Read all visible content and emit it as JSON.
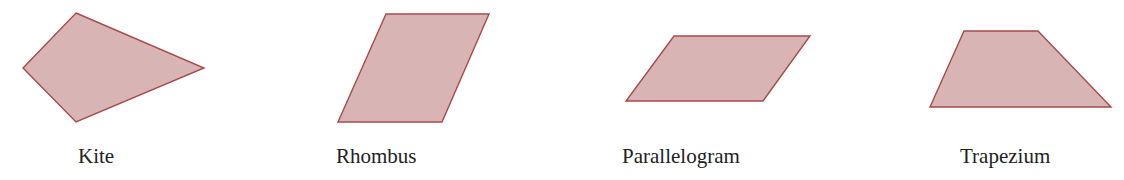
{
  "figure": {
    "style": {
      "fill": "#d9b4b4",
      "stroke": "#a84a4a",
      "label_color": "#222222",
      "background": "#ffffff"
    },
    "shapes": [
      {
        "name": "Kite",
        "label": "Kite",
        "points": "76,13 204,68 76,122 23,68",
        "label_x": 78
      },
      {
        "name": "Rhombus",
        "label": "Rhombus",
        "points": "386,14 489,14 442,122 338,122",
        "label_x": 336
      },
      {
        "name": "Parallelogram",
        "label": "Parallelogram",
        "points": "674,36 810,36 763,101 626,101",
        "label_x": 622
      },
      {
        "name": "Trapezium",
        "label": "Trapezium",
        "points": "964,31 1038,31 1111,107 930,107",
        "label_x": 960
      }
    ]
  }
}
